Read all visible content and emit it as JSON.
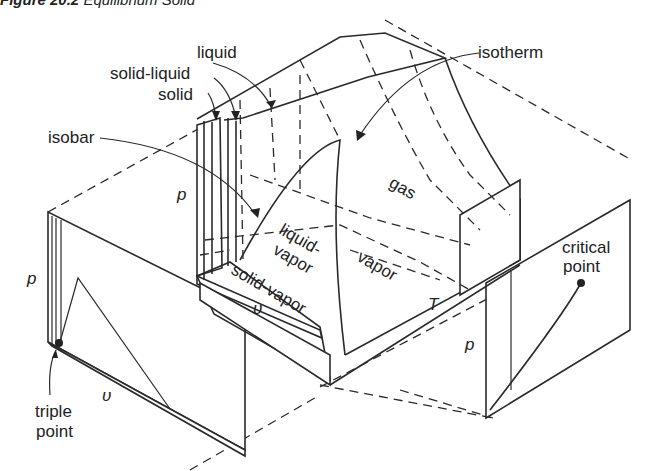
{
  "caption": {
    "number": "Figure 20.2",
    "title": "Equilibrium Solid"
  },
  "labels": {
    "liquid": "liquid",
    "solid_liquid": "solid-liquid",
    "solid": "solid",
    "isobar": "isobar",
    "isotherm": "isotherm",
    "gas": "gas",
    "liquid_vapor_1": "liquid-",
    "liquid_vapor_2": "vapor",
    "vapor": "vapor",
    "solid_vapor": "solid-vapor",
    "triple_point_1": "triple",
    "triple_point_2": "point",
    "critical_point_1": "critical",
    "critical_point_2": "point"
  },
  "axes": {
    "surface_p": "p",
    "surface_v": "υ",
    "surface_T": "T",
    "pv_p": "p",
    "pv_v": "υ",
    "pT_p": "p"
  },
  "colors": {
    "line": "#2a2a2a",
    "background": "#ffffff"
  }
}
